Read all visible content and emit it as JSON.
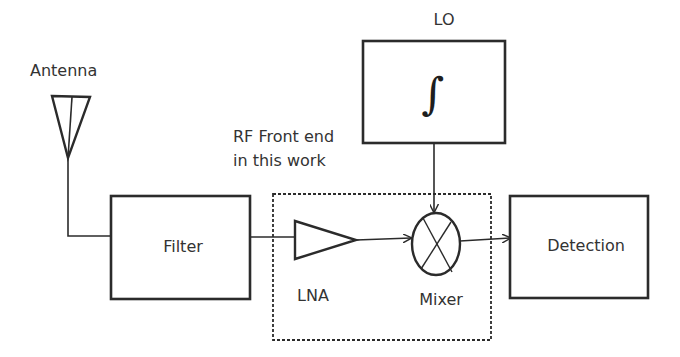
{
  "diagram": {
    "type": "block-diagram",
    "colors": {
      "stroke": "#2b2b2b",
      "text": "#333333",
      "background": "#ffffff"
    },
    "nodes": {
      "antenna": {
        "label": "Antenna",
        "icon": "antenna-icon"
      },
      "filter": {
        "label": "Filter"
      },
      "lna": {
        "label": "LNA",
        "icon": "amplifier-triangle-icon"
      },
      "mixer": {
        "label": "Mixer",
        "icon": "mixer-crossed-circle-icon"
      },
      "lo": {
        "label": "LO",
        "symbol": "∫",
        "icon": "integral-icon"
      },
      "detection": {
        "label": "Detection"
      }
    },
    "group": {
      "label_line1": "RF Front end",
      "label_line2": "in this work",
      "members": [
        "LNA",
        "Mixer"
      ],
      "style": "dashed"
    },
    "edges": [
      {
        "from": "Antenna",
        "to": "Filter",
        "arrow": false
      },
      {
        "from": "Filter",
        "to": "LNA",
        "arrow": false
      },
      {
        "from": "LNA",
        "to": "Mixer",
        "arrow": true
      },
      {
        "from": "LO",
        "to": "Mixer",
        "arrow": true
      },
      {
        "from": "Mixer",
        "to": "Detection",
        "arrow": true
      }
    ]
  }
}
